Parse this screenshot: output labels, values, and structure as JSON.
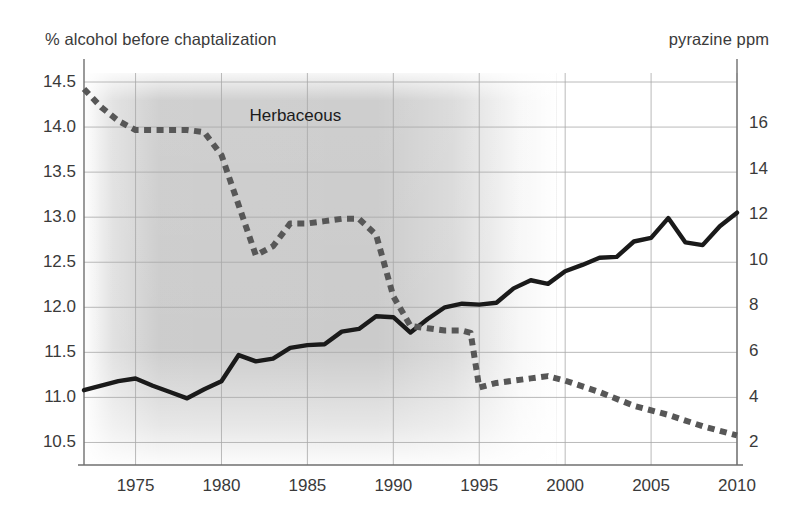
{
  "chart_data": {
    "type": "line",
    "title": "",
    "xlabel": "",
    "ylabel": "% alcohol before chaptalization",
    "y2label": "pyrazine ppm",
    "grid": true,
    "legend": "none",
    "xlim": [
      1972,
      2010
    ],
    "ylim": [
      10.25,
      14.6
    ],
    "y2lim": [
      1.0,
      18.2
    ],
    "xticks": [
      1975,
      1980,
      1985,
      1990,
      1995,
      2000,
      2005,
      2010
    ],
    "xtick_labels": [
      "1975",
      "1980",
      "1985",
      "1990",
      "1995",
      "2000",
      "2005",
      "2010"
    ],
    "yticks": [
      10.5,
      11.0,
      11.5,
      12.0,
      12.5,
      13.0,
      13.5,
      14.0,
      14.5
    ],
    "ytick_labels": [
      "10.5",
      "11.0",
      "11.5",
      "12.0",
      "12.5",
      "13.0",
      "13.5",
      "14.0",
      "14.5"
    ],
    "y2ticks": [
      2,
      4,
      6,
      8,
      10,
      12,
      14,
      16
    ],
    "y2tick_labels": [
      "2",
      "4",
      "6",
      "8",
      "10",
      "12",
      "14",
      "16"
    ],
    "annotations": [
      {
        "text": "Herbaceous",
        "x": 1984.3,
        "y": 14.12
      }
    ],
    "shaded_region": {
      "label": "Herbaceous",
      "x_start": 1972,
      "x_end": 1997,
      "color": "#c8c8c8",
      "fade": true
    },
    "series": [
      {
        "name": "% alcohol before chaptalization",
        "axis": "left",
        "style": "solid",
        "color": "#1a1a1a",
        "x": [
          1972,
          1973,
          1974,
          1975,
          1976,
          1977,
          1978,
          1979,
          1980,
          1981,
          1982,
          1983,
          1984,
          1985,
          1986,
          1987,
          1988,
          1989,
          1990,
          1991,
          1992,
          1993,
          1994,
          1995,
          1996,
          1997,
          1998,
          1999,
          2000,
          2001,
          2002,
          2003,
          2004,
          2005,
          2006,
          2007,
          2008,
          2009,
          2010
        ],
        "y": [
          11.08,
          11.13,
          11.18,
          11.21,
          11.13,
          11.06,
          10.99,
          11.09,
          11.18,
          11.47,
          11.4,
          11.43,
          11.55,
          11.58,
          11.59,
          11.73,
          11.76,
          11.9,
          11.89,
          11.72,
          11.87,
          12.0,
          12.04,
          12.03,
          12.05,
          12.21,
          12.3,
          12.26,
          12.4,
          12.47,
          12.55,
          12.56,
          12.73,
          12.77,
          12.99,
          12.72,
          12.69,
          12.9,
          13.05
        ]
      },
      {
        "name": "pyrazine ppm",
        "axis": "right",
        "style": "dashed",
        "color": "#575757",
        "x": [
          1972,
          1973,
          1974,
          1975,
          1976,
          1977,
          1978,
          1979,
          1980,
          1981,
          1982,
          1983,
          1984,
          1985,
          1986,
          1987,
          1988,
          1989,
          1990,
          1991,
          1992,
          1993,
          1994,
          1994.5,
          1995,
          1996,
          1997,
          1998,
          1999,
          2000,
          2002,
          2004,
          2006,
          2008,
          2010
        ],
        "y_left_scale": [
          14.5,
          14.28,
          14.11,
          14.02,
          14.01,
          14.01,
          14.0,
          13.97,
          13.7,
          13.05,
          12.45,
          12.55,
          12.83,
          12.84,
          12.87,
          12.9,
          12.9,
          12.7,
          11.93,
          11.58,
          11.55,
          11.53,
          11.52,
          11.5,
          10.8,
          10.85,
          10.89,
          10.92,
          10.95,
          10.88,
          10.74,
          10.6,
          10.47,
          10.34,
          10.21
        ],
        "y_ppm": [
          17.5,
          16.7,
          16.1,
          15.7,
          15.7,
          15.7,
          15.7,
          15.6,
          14.6,
          12.4,
          10.2,
          10.6,
          11.6,
          11.6,
          11.7,
          11.8,
          11.8,
          11.1,
          8.4,
          7.1,
          7.0,
          6.9,
          6.9,
          6.8,
          4.4,
          4.6,
          4.7,
          4.8,
          4.9,
          4.7,
          4.2,
          3.6,
          3.2,
          2.7,
          2.3
        ]
      }
    ]
  }
}
